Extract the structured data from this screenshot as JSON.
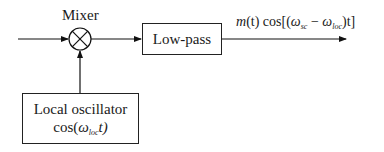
{
  "diagram": {
    "type": "block-diagram",
    "mixer": {
      "label": "Mixer",
      "symbol": "circle-times"
    },
    "lowpass": {
      "label": "Low-pass"
    },
    "oscillator": {
      "line1": "Local oscillator",
      "func": "cos(",
      "omega": "ω",
      "sub": "loc",
      "tail": "t)"
    },
    "output": {
      "m": "m",
      "mt_tail": "(t) cos[(",
      "omega1": "ω",
      "sub1": "sc",
      "minus": " − ",
      "omega2": "ω",
      "sub2": "loc",
      "end": ")t]"
    }
  }
}
